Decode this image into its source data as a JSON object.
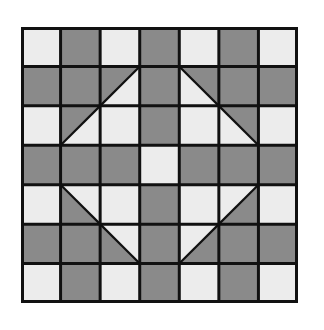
{
  "grid": {
    "rows": 7,
    "cols": 7,
    "colors": {
      "light": "#ececec",
      "dark": "#8a8a8a",
      "line": "#111111"
    },
    "cells": [
      [
        "L",
        "D",
        "L",
        "D",
        "L",
        "D",
        "L"
      ],
      [
        "D",
        "D",
        "T:dUL",
        "D",
        "T:dUR",
        "D",
        "D"
      ],
      [
        "L",
        "T:dUL",
        "L",
        "D",
        "L",
        "T:dUR",
        "L"
      ],
      [
        "D",
        "D",
        "D",
        "L",
        "D",
        "D",
        "D"
      ],
      [
        "L",
        "T:dLL",
        "L",
        "D",
        "L",
        "T:dLR",
        "L"
      ],
      [
        "D",
        "D",
        "T:dLL",
        "D",
        "T:dLR",
        "D",
        "D"
      ],
      [
        "L",
        "D",
        "L",
        "D",
        "L",
        "D",
        "L"
      ]
    ]
  }
}
